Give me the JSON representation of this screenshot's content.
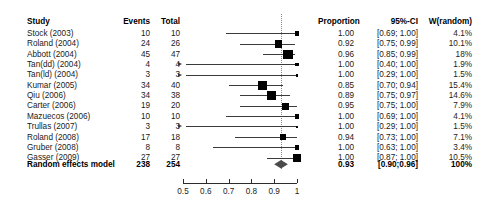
{
  "headers": {
    "study": "Study",
    "events": "Events",
    "total": "Total",
    "proportion": "Proportion",
    "ci": "95%-CI",
    "weight": "W(random)"
  },
  "summary": {
    "label": "Random effects model",
    "events": "238",
    "total": "254",
    "proportion": "0.93",
    "ci": "[0.90;0.96]",
    "weight": "100%"
  },
  "rows": [
    {
      "study": "Stock (2003)",
      "events": "10",
      "total": "10",
      "proportion": "1.00",
      "ci": "[0.69; 1.00]",
      "weight": "4.1%"
    },
    {
      "study": "Roland (2004)",
      "events": "24",
      "total": "26",
      "proportion": "0.92",
      "ci": "[0.75; 0.99]",
      "weight": "10.1%"
    },
    {
      "study": "Abbott (2004)",
      "events": "45",
      "total": "47",
      "proportion": "0.96",
      "ci": "[0.85; 0.99]",
      "weight": "18%"
    },
    {
      "study": "Tan(dd) (2004)",
      "events": "4",
      "total": "4",
      "proportion": "1.00",
      "ci": "[0.40; 1.00]",
      "weight": "1.9%"
    },
    {
      "study": "Tan(ld) (2004)",
      "events": "3",
      "total": "3",
      "proportion": "1.00",
      "ci": "[0.29; 1.00]",
      "weight": "1.5%"
    },
    {
      "study": "Kumar (2005)",
      "events": "34",
      "total": "40",
      "proportion": "0.85",
      "ci": "[0.70; 0.94]",
      "weight": "15.4%"
    },
    {
      "study": "Qiu (2006)",
      "events": "34",
      "total": "38",
      "proportion": "0.89",
      "ci": "[0.75; 0.97]",
      "weight": "14.6%"
    },
    {
      "study": "Carter (2006)",
      "events": "19",
      "total": "20",
      "proportion": "0.95",
      "ci": "[0.75; 1.00]",
      "weight": "7.9%"
    },
    {
      "study": "Mazuecos (2006)",
      "events": "10",
      "total": "10",
      "proportion": "1.00",
      "ci": "[0.69; 1.00]",
      "weight": "4.1%"
    },
    {
      "study": "Trullas (2007)",
      "events": "3",
      "total": "3",
      "proportion": "1.00",
      "ci": "[0.29; 1.00]",
      "weight": "1.5%"
    },
    {
      "study": "Roland (2008)",
      "events": "17",
      "total": "18",
      "proportion": "0.94",
      "ci": "[0.73; 1.00]",
      "weight": "7.1%"
    },
    {
      "study": "Gruber (2008)",
      "events": "8",
      "total": "8",
      "proportion": "1.00",
      "ci": "[0.63; 1.00]",
      "weight": "3.4%"
    },
    {
      "study": "Gasser (2009)",
      "events": "27",
      "total": "27",
      "proportion": "1.00",
      "ci": "[0.87; 1.00]",
      "weight": "10.5%"
    }
  ],
  "chart_data": {
    "type": "forest",
    "title": "",
    "xlabel": "",
    "ylabel": "",
    "xlim": [
      0.45,
      1.0
    ],
    "axis_ticks": [
      {
        "value": 0.5,
        "label": "0.5"
      },
      {
        "value": 0.6,
        "label": "0.6"
      },
      {
        "value": 0.7,
        "label": "0.7"
      },
      {
        "value": 0.8,
        "label": "0.8"
      },
      {
        "value": 0.9,
        "label": "0.9"
      },
      {
        "value": 1.0,
        "label": "1"
      }
    ],
    "reference_line": 0.93,
    "grid": false,
    "legend": "none",
    "effect_measure": "Proportion",
    "model": "Random effects model",
    "categories": [
      "Stock (2003)",
      "Roland (2004)",
      "Abbott (2004)",
      "Tan(dd) (2004)",
      "Tan(ld) (2004)",
      "Kumar (2005)",
      "Qiu (2006)",
      "Carter (2006)",
      "Mazuecos (2006)",
      "Trullas (2007)",
      "Roland (2008)",
      "Gruber (2008)",
      "Gasser (2009)"
    ],
    "estimates": [
      1.0,
      0.92,
      0.96,
      1.0,
      1.0,
      0.85,
      0.89,
      0.95,
      1.0,
      1.0,
      0.94,
      1.0,
      1.0
    ],
    "ci_lower": [
      0.69,
      0.75,
      0.85,
      0.4,
      0.29,
      0.7,
      0.75,
      0.75,
      0.69,
      0.29,
      0.73,
      0.63,
      0.87
    ],
    "ci_upper": [
      1.0,
      0.99,
      0.99,
      1.0,
      1.0,
      0.94,
      0.97,
      1.0,
      1.0,
      1.0,
      1.0,
      1.0,
      1.0
    ],
    "weights": [
      4.1,
      10.1,
      18.0,
      1.9,
      1.5,
      15.4,
      14.6,
      7.9,
      4.1,
      1.5,
      7.1,
      3.4,
      10.5
    ],
    "events": [
      10,
      24,
      45,
      4,
      3,
      34,
      34,
      19,
      10,
      3,
      17,
      8,
      27
    ],
    "totals": [
      10,
      26,
      47,
      4,
      3,
      40,
      38,
      20,
      10,
      3,
      18,
      8,
      27
    ],
    "pooled": {
      "estimate": 0.93,
      "ci_lower": 0.9,
      "ci_upper": 0.96,
      "weight": 100,
      "events": 238,
      "total": 254
    }
  }
}
